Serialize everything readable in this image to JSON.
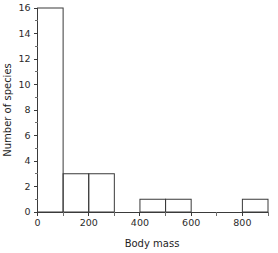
{
  "chart_data": {
    "type": "bar",
    "title": "",
    "xlabel": "Body mass",
    "ylabel": "Number of species",
    "bin_width": 100,
    "bin_edges": [
      0,
      100,
      200,
      300,
      400,
      500,
      600,
      700,
      800,
      900
    ],
    "categories": [
      "0-100",
      "100-200",
      "200-300",
      "300-400",
      "400-500",
      "500-600",
      "600-700",
      "700-800",
      "800-900"
    ],
    "values": [
      16,
      3,
      3,
      0,
      1,
      1,
      0,
      0,
      1
    ],
    "xlim": [
      0,
      900
    ],
    "ylim": [
      0,
      16
    ],
    "x_ticks": [
      0,
      100,
      200,
      300,
      400,
      500,
      600,
      700,
      800,
      900
    ],
    "x_ticklabels": [
      "0",
      "",
      "200",
      "",
      "400",
      "",
      "600",
      "",
      "800",
      ""
    ],
    "x_major_ticks": [
      0,
      200,
      400,
      600,
      800
    ],
    "y_major_ticks": [
      0,
      2,
      4,
      6,
      8,
      10,
      12,
      14,
      16
    ],
    "y_minor_ticks": [
      1,
      3,
      5,
      7,
      9,
      11,
      13,
      15
    ],
    "y_ticklabels": [
      "0",
      "2",
      "4",
      "6",
      "8",
      "10",
      "12",
      "14",
      "16"
    ],
    "grid": false,
    "legend": null,
    "bar_fill": "none",
    "line_color": "#3a3a3a",
    "background": "#ffffff"
  }
}
